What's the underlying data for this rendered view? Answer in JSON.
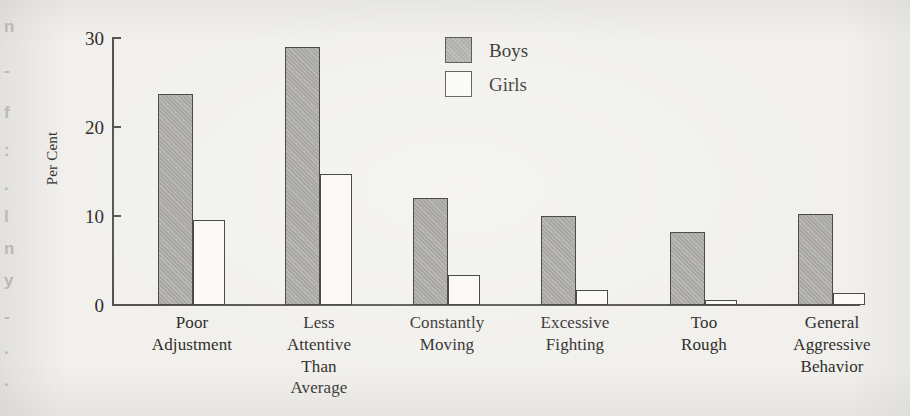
{
  "page": {
    "background_color": "#f1f0ec",
    "gutter_bleed_fragments": [
      "n",
      "-",
      "f",
      ":",
      ".",
      "l",
      "n",
      "y",
      "-",
      ".",
      "."
    ]
  },
  "legend": {
    "position": "top-center",
    "items": [
      {
        "label": "Boys",
        "swatch": "filled-gray-square",
        "color": "#a9a8a4"
      },
      {
        "label": "Girls",
        "swatch": "outlined-white-square",
        "color": "#fbfaf7"
      }
    ]
  },
  "axis": {
    "y_title": "Per Cent",
    "y_ticks": [
      "0",
      "10",
      "20",
      "30"
    ]
  },
  "chart_data": {
    "type": "bar",
    "title": "",
    "xlabel": "",
    "ylabel": "Per Cent",
    "ylim": [
      0,
      30
    ],
    "yticks": [
      0,
      10,
      20,
      30
    ],
    "grid": false,
    "legend_position": "top-center",
    "categories": [
      "Poor Adjustment",
      "Less Attentive Than Average",
      "Constantly Moving",
      "Excessive Fighting",
      "Too Rough",
      "General Aggressive Behavior"
    ],
    "category_lines": [
      [
        "Poor",
        "Adjustment"
      ],
      [
        "Less",
        "Attentive",
        "Than",
        "Average"
      ],
      [
        "Constantly",
        "Moving"
      ],
      [
        "Excessive",
        "Fighting"
      ],
      [
        "Too",
        "Rough"
      ],
      [
        "General",
        "Aggressive",
        "Behavior"
      ]
    ],
    "series": [
      {
        "name": "Boys",
        "color": "#a9a8a4",
        "values": [
          23.7,
          29.0,
          12.0,
          10.0,
          8.2,
          10.2
        ]
      },
      {
        "name": "Girls",
        "color": "#fbfaf7",
        "values": [
          9.6,
          14.7,
          3.4,
          1.7,
          0.6,
          1.3
        ]
      }
    ]
  },
  "geometry": {
    "baseline_y": 305,
    "top_y": 38,
    "px_per_unit": 8.9,
    "groups": [
      {
        "boys_x": 158,
        "boys_w": 35,
        "girls_x": 193,
        "girls_w": 32,
        "label_center": 192
      },
      {
        "boys_x": 285,
        "boys_w": 35,
        "girls_x": 320,
        "girls_w": 32,
        "label_center": 319
      },
      {
        "boys_x": 413,
        "boys_w": 35,
        "girls_x": 448,
        "girls_w": 32,
        "label_center": 447
      },
      {
        "boys_x": 541,
        "boys_w": 35,
        "girls_x": 576,
        "girls_w": 32,
        "label_center": 575
      },
      {
        "boys_x": 670,
        "boys_w": 35,
        "girls_x": 705,
        "girls_w": 32,
        "label_center": 704
      },
      {
        "boys_x": 798,
        "boys_w": 35,
        "girls_x": 833,
        "girls_w": 32,
        "label_center": 832
      }
    ]
  }
}
